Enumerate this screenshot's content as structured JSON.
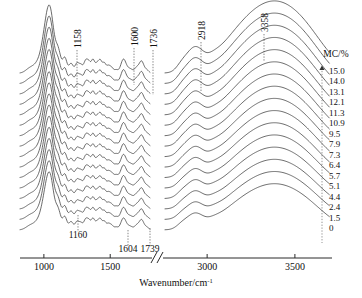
{
  "figure": {
    "background": "#ffffff",
    "line_color": "#3b3b3b",
    "axis_color": "#2b2b2b"
  },
  "axis": {
    "title": "Wavenumber/cm",
    "title_superscript": "-1",
    "ticks_left": [
      "1000",
      "1500"
    ],
    "ticks_right": [
      "3000",
      "3500"
    ],
    "break_symbol": "//"
  },
  "legend": {
    "header": "MC/%",
    "arrow": "up-arrow",
    "values": [
      "15.0",
      "14.0",
      "13.1",
      "12.1",
      "11.3",
      "10.9",
      "9.5",
      "7.9",
      "7.3",
      "6.4",
      "5.7",
      "5.1",
      "4.4",
      "2.4",
      "1.5",
      "0"
    ]
  },
  "peak_labels_top": [
    {
      "text": "1158",
      "x": 77
    },
    {
      "text": "1600",
      "x": 134
    },
    {
      "text": "1736",
      "x": 153
    },
    {
      "text": "2918",
      "x": 201
    },
    {
      "text": "3358",
      "x": 264
    }
  ],
  "peak_labels_bottom": [
    {
      "text": "1160",
      "x": 78
    },
    {
      "text": "1604",
      "x": 128
    },
    {
      "text": "1739",
      "x": 150
    }
  ],
  "chart_data": {
    "type": "line",
    "title": "",
    "xlabel": "Wavenumber/cm-1",
    "ylabel": "",
    "grid": false,
    "legend_position": "right",
    "legend_title": "MC/%",
    "x_axis_broken": true,
    "x_segments": [
      {
        "range": [
          800,
          1800
        ],
        "ticks": [
          1000,
          1500
        ]
      },
      {
        "range": [
          2750,
          3700
        ],
        "ticks": [
          3000,
          3500
        ]
      }
    ],
    "annotations": [
      {
        "label": "1158",
        "wavenumber": 1158,
        "position": "top"
      },
      {
        "label": "1600",
        "wavenumber": 1600,
        "position": "top"
      },
      {
        "label": "1736",
        "wavenumber": 1736,
        "position": "top"
      },
      {
        "label": "2918",
        "wavenumber": 2918,
        "position": "top"
      },
      {
        "label": "3358",
        "wavenumber": 3358,
        "position": "top"
      },
      {
        "label": "1160",
        "wavenumber": 1160,
        "position": "bottom"
      },
      {
        "label": "1604",
        "wavenumber": 1604,
        "position": "bottom"
      },
      {
        "label": "1739",
        "wavenumber": 1739,
        "position": "bottom"
      }
    ],
    "series": [
      {
        "name": "15.0"
      },
      {
        "name": "14.0"
      },
      {
        "name": "13.1"
      },
      {
        "name": "12.1"
      },
      {
        "name": "11.3"
      },
      {
        "name": "10.9"
      },
      {
        "name": "9.5"
      },
      {
        "name": "7.9"
      },
      {
        "name": "7.3"
      },
      {
        "name": "6.4"
      },
      {
        "name": "5.7"
      },
      {
        "name": "5.1"
      },
      {
        "name": "4.4"
      },
      {
        "name": "2.4"
      },
      {
        "name": "1.5"
      },
      {
        "name": "0"
      }
    ],
    "series_count": 16,
    "peaks_left_panel": [
      1030,
      1060,
      1110,
      1158,
      1205,
      1250,
      1315,
      1370,
      1425,
      1460,
      1510,
      1600,
      1736
    ],
    "peaks_right_panel": [
      2918,
      3358
    ]
  }
}
